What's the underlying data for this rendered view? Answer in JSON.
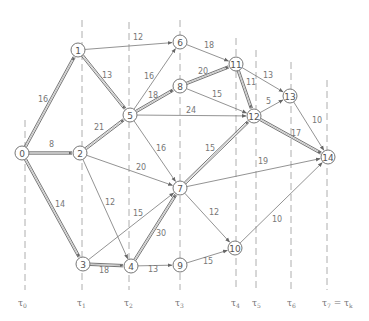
{
  "diagram": {
    "type": "network-graph",
    "nodes": [
      {
        "id": "0",
        "x": 22,
        "y": 153
      },
      {
        "id": "1",
        "x": 78,
        "y": 50
      },
      {
        "id": "2",
        "x": 80,
        "y": 153
      },
      {
        "id": "3",
        "x": 83,
        "y": 264
      },
      {
        "id": "4",
        "x": 131,
        "y": 266
      },
      {
        "id": "5",
        "x": 130,
        "y": 115
      },
      {
        "id": "6",
        "x": 180,
        "y": 42
      },
      {
        "id": "7",
        "x": 180,
        "y": 188
      },
      {
        "id": "8",
        "x": 180,
        "y": 86
      },
      {
        "id": "9",
        "x": 180,
        "y": 265
      },
      {
        "id": "10",
        "x": 235,
        "y": 248
      },
      {
        "id": "11",
        "x": 236,
        "y": 64
      },
      {
        "id": "12",
        "x": 254,
        "y": 116
      },
      {
        "id": "13",
        "x": 290,
        "y": 96
      },
      {
        "id": "14",
        "x": 328,
        "y": 157
      }
    ],
    "edges": [
      {
        "from": "0",
        "to": "1",
        "weight": "16",
        "critical": true,
        "lx": 38,
        "ly": 102
      },
      {
        "from": "0",
        "to": "2",
        "weight": "8",
        "critical": true,
        "lx": 49,
        "ly": 147
      },
      {
        "from": "0",
        "to": "3",
        "weight": "14",
        "critical": true,
        "lx": 55,
        "ly": 207
      },
      {
        "from": "1",
        "to": "6",
        "weight": "12",
        "critical": false,
        "lx": 133,
        "ly": 40
      },
      {
        "from": "1",
        "to": "5",
        "weight": "13",
        "critical": true,
        "lx": 102,
        "ly": 78
      },
      {
        "from": "2",
        "to": "5",
        "weight": "21",
        "critical": true,
        "lx": 94,
        "ly": 130
      },
      {
        "from": "2",
        "to": "7",
        "weight": "20",
        "critical": false,
        "lx": 136,
        "ly": 170
      },
      {
        "from": "2",
        "to": "4",
        "weight": "12",
        "critical": false,
        "lx": 105,
        "ly": 205
      },
      {
        "from": "3",
        "to": "4",
        "weight": "18",
        "critical": true,
        "lx": 99,
        "ly": 273
      },
      {
        "from": "3",
        "to": "7",
        "weight": "15",
        "critical": false,
        "lx": 133,
        "ly": 216
      },
      {
        "from": "4",
        "to": "7",
        "weight": "30",
        "critical": true,
        "lx": 156,
        "ly": 236
      },
      {
        "from": "4",
        "to": "9",
        "weight": "13",
        "critical": false,
        "lx": 148,
        "ly": 272
      },
      {
        "from": "5",
        "to": "6",
        "weight": "16",
        "critical": false,
        "lx": 144,
        "ly": 79
      },
      {
        "from": "5",
        "to": "8",
        "weight": "18",
        "critical": true,
        "lx": 148,
        "ly": 98
      },
      {
        "from": "5",
        "to": "12",
        "weight": "24",
        "critical": false,
        "lx": 186,
        "ly": 113
      },
      {
        "from": "5",
        "to": "7",
        "weight": "16",
        "critical": false,
        "lx": 156,
        "ly": 151
      },
      {
        "from": "6",
        "to": "11",
        "weight": "18",
        "critical": false,
        "lx": 204,
        "ly": 48
      },
      {
        "from": "8",
        "to": "11",
        "weight": "20",
        "critical": true,
        "lx": 198,
        "ly": 74
      },
      {
        "from": "8",
        "to": "12",
        "weight": "15",
        "critical": false,
        "lx": 212,
        "ly": 97
      },
      {
        "from": "7",
        "to": "12",
        "weight": "15",
        "critical": true,
        "lx": 205,
        "ly": 151
      },
      {
        "from": "7",
        "to": "14",
        "weight": "19",
        "critical": false,
        "lx": 258,
        "ly": 164
      },
      {
        "from": "7",
        "to": "10",
        "weight": "12",
        "critical": false,
        "lx": 209,
        "ly": 215
      },
      {
        "from": "9",
        "to": "10",
        "weight": "15",
        "critical": false,
        "lx": 203,
        "ly": 264
      },
      {
        "from": "11",
        "to": "12",
        "weight": "11",
        "critical": true,
        "lx": 246,
        "ly": 85
      },
      {
        "from": "11",
        "to": "13",
        "weight": "13",
        "critical": false,
        "lx": 263,
        "ly": 78
      },
      {
        "from": "12",
        "to": "13",
        "weight": "5",
        "critical": false,
        "lx": 266,
        "ly": 104
      },
      {
        "from": "12",
        "to": "14",
        "weight": "17",
        "critical": true,
        "lx": 291,
        "ly": 136
      },
      {
        "from": "13",
        "to": "14",
        "weight": "10",
        "critical": false,
        "lx": 312,
        "ly": 123
      },
      {
        "from": "10",
        "to": "14",
        "weight": "10",
        "critical": false,
        "lx": 272,
        "ly": 222
      }
    ],
    "stage_lines": [
      {
        "x": 25,
        "y1": 120,
        "y2": 290,
        "label": "τ",
        "sub": "0",
        "lx": 18
      },
      {
        "x": 82,
        "y1": 20,
        "y2": 290,
        "label": "τ",
        "sub": "1",
        "lx": 77
      },
      {
        "x": 129,
        "y1": 22,
        "y2": 290,
        "label": "τ",
        "sub": "2",
        "lx": 124
      },
      {
        "x": 180,
        "y1": 20,
        "y2": 290,
        "label": "τ",
        "sub": "3",
        "lx": 175
      },
      {
        "x": 236,
        "y1": 38,
        "y2": 290,
        "label": "τ",
        "sub": "4",
        "lx": 231
      },
      {
        "x": 256,
        "y1": 50,
        "y2": 290,
        "label": "τ",
        "sub": "5",
        "lx": 252
      },
      {
        "x": 291,
        "y1": 62,
        "y2": 290,
        "label": "τ",
        "sub": "6",
        "lx": 287
      },
      {
        "x": 327,
        "y1": 80,
        "y2": 290,
        "label": "τ",
        "sub": "7",
        "suffix": " = τ",
        "suffix_sub": "k",
        "lx": 322
      }
    ],
    "colors": {
      "edge": "#777777",
      "critical_edge": "#666666",
      "node_stroke": "#777777",
      "text": "#666666"
    }
  }
}
